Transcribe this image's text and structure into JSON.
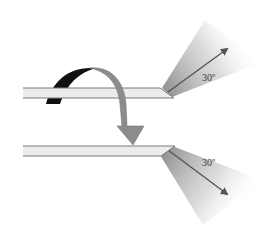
{
  "diagram": {
    "type": "blade-flip-angle-illustration",
    "top_blade": {
      "angle_label": "30º",
      "arrow_direction": "up-right"
    },
    "bottom_blade": {
      "angle_label": "30º",
      "arrow_direction": "down-right"
    },
    "flip_arrow": {
      "icon": "curved-flip-arrow",
      "meaning": "rotate blade over"
    },
    "colors": {
      "blade_fill": "#ececec",
      "blade_edge": "#7a7a7a",
      "fan_shade": "#9a9a9a",
      "arrow_line": "#555555",
      "flip_arrow_front": "#8c8c8c",
      "flip_arrow_back": "#111111",
      "background": "#ffffff"
    }
  }
}
